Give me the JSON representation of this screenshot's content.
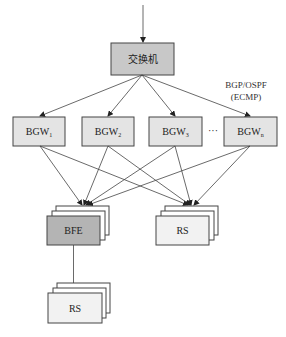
{
  "diagram": {
    "switch": {
      "label": "交换机",
      "fill": "#c8c8c8"
    },
    "protocol_label": {
      "line1": "BGP/OSPF",
      "line2": "(ECMP)"
    },
    "bgw_nodes": [
      {
        "base": "BGW",
        "sub": "1"
      },
      {
        "base": "BGW",
        "sub": "2"
      },
      {
        "base": "BGW",
        "sub": "3"
      },
      {
        "base": "BGW",
        "sub": "n"
      }
    ],
    "ellipsis": "···",
    "bfe": {
      "label": "BFE",
      "fill": "#b4b4b4"
    },
    "rs_right": {
      "label": "RS",
      "fill": "#f2f2f2"
    },
    "rs_bottom": {
      "label": "RS",
      "fill": "#f2f2f2"
    },
    "colors": {
      "bgw_fill": "#e4e4e4",
      "stroke": "#444444"
    }
  }
}
